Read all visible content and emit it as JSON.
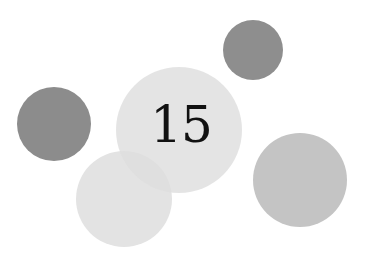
{
  "number": "15",
  "circles": [
    {
      "name": "left-dark-circle",
      "cx": 54,
      "cy": 124,
      "r": 37,
      "color": "#8c8c8c"
    },
    {
      "name": "top-right-dark-circle",
      "cx": 253,
      "cy": 50,
      "r": 30,
      "color": "#8e8e8e"
    },
    {
      "name": "lower-left-light-circle",
      "cx": 124,
      "cy": 199,
      "r": 48,
      "color": "#e3e3e3"
    },
    {
      "name": "center-circle",
      "cx": 179,
      "cy": 130,
      "r": 63,
      "color": "#e6e6e6"
    },
    {
      "name": "right-mid-circle",
      "cx": 300,
      "cy": 180,
      "r": 47,
      "color": "#c4c4c4"
    }
  ]
}
